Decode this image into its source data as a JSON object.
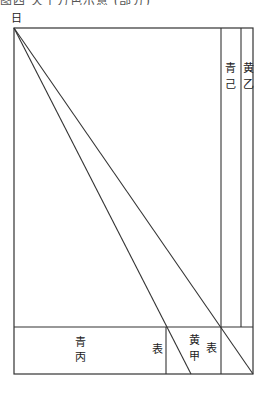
{
  "diagram": {
    "top_cut_text": "图四 天干方色示意 (部分)",
    "corner_label": "日",
    "column_labels": [
      {
        "top": "青",
        "bottom": "己"
      },
      {
        "top": "黄",
        "bottom": "乙"
      }
    ],
    "band_labels": {
      "left_cell": {
        "top": "青",
        "bottom": "丙"
      },
      "left_cell_side": "表",
      "middle_cell": {
        "top": "黄",
        "bottom": "甲"
      },
      "middle_cell_side": "表"
    },
    "colors": {
      "line": "#333333",
      "background": "#ffffff"
    }
  }
}
